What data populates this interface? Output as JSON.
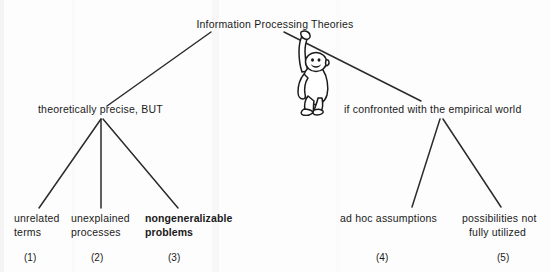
{
  "diagram": {
    "type": "tree",
    "title_node": {
      "id": "root",
      "label": "Information Processing Theories"
    },
    "branch_nodes": [
      {
        "id": "left",
        "label": "theoretically precise, BUT"
      },
      {
        "id": "right",
        "label": "if confronted with the empirical world"
      }
    ],
    "leaf_nodes": [
      {
        "id": "leaf1",
        "number": "(1)",
        "line1": "unrelated",
        "line2": "terms",
        "bold": false,
        "parent": "left"
      },
      {
        "id": "leaf2",
        "number": "(2)",
        "line1": "unexplained",
        "line2": "processes",
        "bold": false,
        "parent": "left"
      },
      {
        "id": "leaf3",
        "number": "(3)",
        "line1": "nongeneralizable",
        "line2": "problems",
        "bold": true,
        "parent": "left"
      },
      {
        "id": "leaf4",
        "number": "(4)",
        "line1": "ad hoc assumptions",
        "line2": "",
        "bold": false,
        "parent": "right"
      },
      {
        "id": "leaf5",
        "number": "(5)",
        "line1": "possibilities not",
        "line2": "fully utilized",
        "bold": false,
        "parent": "right"
      }
    ],
    "illustration": {
      "name": "hanging-monkey",
      "description": "line drawing of an ape hanging by one arm from the right branch line"
    },
    "colors": {
      "ink": "#1a1a1a",
      "background": "#fdfdfd",
      "line": "#2b2b2b"
    }
  }
}
